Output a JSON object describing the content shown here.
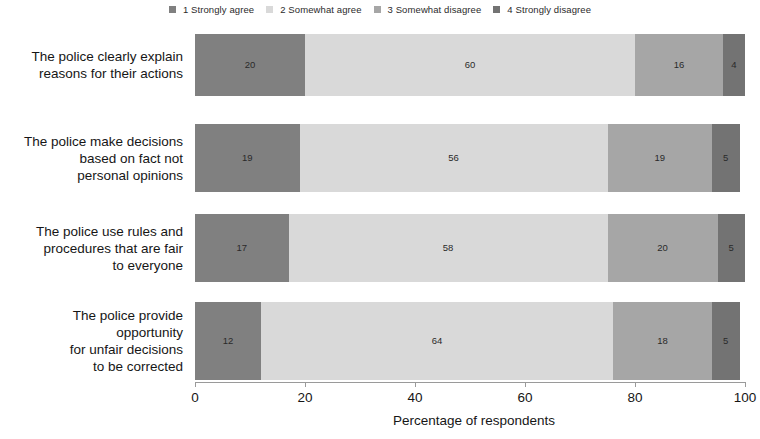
{
  "chart_data": {
    "type": "bar",
    "orientation": "horizontal",
    "stacked": true,
    "stack_mode": "percent",
    "title": "",
    "xlabel": "Percentage of respondents",
    "ylabel": "",
    "xlim": [
      0,
      100
    ],
    "xticks": [
      0,
      20,
      40,
      60,
      80,
      100
    ],
    "xtick_labels": [
      "0",
      "20",
      "40",
      "60",
      "80",
      "100"
    ],
    "grid": false,
    "legend_position": "top-center",
    "categories": [
      "The police clearly explain reasons for their actions",
      "The police make decisions based on fact not personal opinions",
      "The police use rules and procedures that are fair to everyone",
      "The police provide opportunity for unfair decisions to be corrected"
    ],
    "series": [
      {
        "name": "1 Strongly agree",
        "color": "#808080",
        "values": [
          20,
          19,
          17,
          12
        ]
      },
      {
        "name": "2 Somewhat agree",
        "color": "#d9d9d9",
        "values": [
          60,
          56,
          58,
          64
        ]
      },
      {
        "name": "3 Somewhat disagree",
        "color": "#a6a6a6",
        "values": [
          16,
          19,
          20,
          18
        ]
      },
      {
        "name": "4 Strongly disagree",
        "color": "#737373",
        "values": [
          4,
          5,
          5,
          5
        ]
      }
    ]
  },
  "legend": {
    "entries": [
      {
        "label": "1 Strongly agree",
        "color": "#808080"
      },
      {
        "label": "2 Somewhat agree",
        "color": "#d9d9d9"
      },
      {
        "label": "3 Somewhat disagree",
        "color": "#a6a6a6"
      },
      {
        "label": "4 Strongly disagree",
        "color": "#737373"
      }
    ]
  },
  "categories": [
    {
      "lines": [
        "The police clearly explain",
        "reasons for their actions"
      ]
    },
    {
      "lines": [
        "The police make decisions",
        "based on fact not",
        "personal opinions"
      ]
    },
    {
      "lines": [
        "The police use rules and",
        "procedures that are fair",
        "to everyone"
      ]
    },
    {
      "lines": [
        "The police provide",
        "opportunity",
        "for unfair decisions",
        "to be corrected"
      ]
    }
  ],
  "axis": {
    "ticks": [
      "0",
      "20",
      "40",
      "60",
      "80",
      "100"
    ],
    "title": "Percentage of respondents"
  }
}
